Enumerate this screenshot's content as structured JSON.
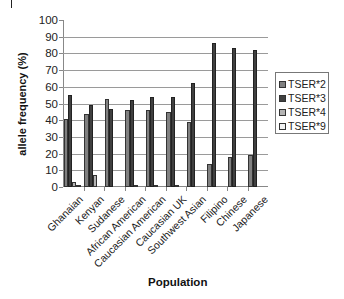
{
  "chart_data": {
    "type": "bar",
    "title": "",
    "xlabel": "Population",
    "ylabel": "allele frequency (%)",
    "ylim": [
      0,
      100
    ],
    "yticks": [
      0,
      10,
      20,
      30,
      40,
      50,
      60,
      70,
      80,
      90,
      100
    ],
    "grid": true,
    "legend_position": "right",
    "categories": [
      "Ghanaian",
      "Kenyan",
      "Sudanese",
      "African American",
      "Caucasian American",
      "Caucasian UK",
      "Southwest Asian",
      "Filipino",
      "Chinese",
      "Japanese"
    ],
    "series": [
      {
        "name": "TSER*2",
        "color": "#808080",
        "values": [
          41,
          44,
          53,
          46,
          46,
          45,
          39,
          14,
          18,
          19
        ]
      },
      {
        "name": "TSER*3",
        "color": "#404040",
        "values": [
          55,
          49,
          47,
          52,
          54,
          54,
          62,
          86,
          83,
          82
        ]
      },
      {
        "name": "TSER*4",
        "color": "#b4b4b4",
        "values": [
          3,
          7,
          0,
          1,
          1,
          1,
          0,
          0,
          0,
          0
        ]
      },
      {
        "name": "TSER*9",
        "color": "#f2f2f2",
        "values": [
          1,
          0,
          0,
          0,
          0,
          0,
          0,
          0,
          0,
          0
        ]
      }
    ]
  }
}
